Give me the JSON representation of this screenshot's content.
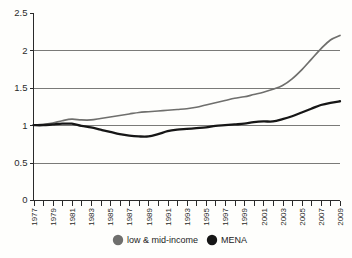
{
  "chart_data": {
    "type": "line",
    "title": "",
    "subtitle": "",
    "xlabel": "",
    "ylabel": "",
    "grid": true,
    "legend_position": "bottom",
    "xlim": [
      1977,
      2009
    ],
    "ylim": [
      0,
      2.5
    ],
    "ytick_labels": [
      "2.5",
      "2",
      "1.5",
      "1",
      "0.5",
      "0"
    ],
    "ytick_values": [
      2.5,
      2,
      1.5,
      1,
      0.5,
      0
    ],
    "xtick_labels": [
      "1977",
      "1979",
      "1981",
      "1983",
      "1985",
      "1987",
      "1989",
      "1991",
      "1993",
      "1995",
      "1997",
      "1999",
      "2001",
      "2003",
      "2005",
      "2007",
      "2009"
    ],
    "x": [
      1977,
      1978,
      1979,
      1980,
      1981,
      1982,
      1983,
      1984,
      1985,
      1986,
      1987,
      1988,
      1989,
      1990,
      1991,
      1992,
      1993,
      1994,
      1995,
      1996,
      1997,
      1998,
      1999,
      2000,
      2001,
      2002,
      2003,
      2004,
      2005,
      2006,
      2007,
      2008,
      2009
    ],
    "series": [
      {
        "name": "low & mid-income",
        "color": "#6f6f6d",
        "values": [
          1.0,
          1.01,
          1.03,
          1.06,
          1.08,
          1.07,
          1.07,
          1.09,
          1.11,
          1.13,
          1.15,
          1.17,
          1.18,
          1.19,
          1.2,
          1.21,
          1.22,
          1.24,
          1.27,
          1.3,
          1.33,
          1.36,
          1.38,
          1.41,
          1.44,
          1.48,
          1.53,
          1.62,
          1.74,
          1.88,
          2.02,
          2.14,
          2.2
        ]
      },
      {
        "name": "MENA",
        "color": "#161616",
        "values": [
          1.0,
          1.0,
          1.01,
          1.02,
          1.02,
          0.99,
          0.97,
          0.94,
          0.91,
          0.88,
          0.86,
          0.85,
          0.85,
          0.88,
          0.92,
          0.94,
          0.95,
          0.96,
          0.97,
          0.99,
          1.0,
          1.01,
          1.02,
          1.04,
          1.05,
          1.05,
          1.08,
          1.12,
          1.17,
          1.22,
          1.27,
          1.3,
          1.32
        ]
      }
    ]
  },
  "legend": {
    "items": [
      {
        "label": "low & mid-income",
        "color": "#6f6f6d"
      },
      {
        "label": "MENA",
        "color": "#161616"
      }
    ]
  }
}
